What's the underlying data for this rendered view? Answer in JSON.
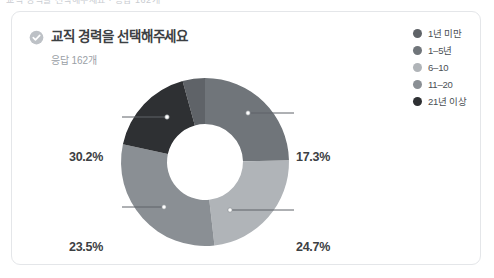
{
  "top_strip_text": "교직 경력을 선택해주세요 · 응답 162개",
  "card": {
    "header": {
      "verified_icon": "verified-check-icon",
      "title": "교직 경력을 선택해주세요",
      "subtitle": "응답 162개"
    },
    "legend": {
      "items": [
        {
          "label": "1년 미만",
          "color": "#5f6368"
        },
        {
          "label": "1–5년",
          "color": "#70757a"
        },
        {
          "label": "6–10",
          "color": "#b0b4b8"
        },
        {
          "label": "11–20",
          "color": "#8a8f94"
        },
        {
          "label": "21년 이상",
          "color": "#2e3033"
        }
      ]
    }
  },
  "chart_data": {
    "type": "pie",
    "title": "교직 경력을 선택해주세요",
    "subtitle": "응답 162개",
    "donut": true,
    "total_responses": 162,
    "units": "%",
    "legend_position": "top-right",
    "grid": false,
    "categories": [
      "1년 미만",
      "1–5년",
      "6–10",
      "11–20",
      "21년 이상"
    ],
    "values": [
      4.3,
      24.7,
      23.5,
      30.2,
      17.3
    ],
    "colors": [
      "#5f6368",
      "#70757a",
      "#b0b4b8",
      "#8a8f94",
      "#2e3033"
    ],
    "labels_shown": [
      "17.3%",
      "24.7%",
      "23.5%",
      "30.2%"
    ],
    "slices": [
      {
        "name": "1년 미만",
        "value": 4.3,
        "label": "",
        "color": "#5f6368"
      },
      {
        "name": "1–5년",
        "value": 24.7,
        "label": "24.7%",
        "color": "#70757a"
      },
      {
        "name": "6–10",
        "value": 23.5,
        "label": "23.5%",
        "color": "#b0b4b8"
      },
      {
        "name": "11–20",
        "value": 30.2,
        "label": "30.2%",
        "color": "#8a8f94"
      },
      {
        "name": "21년 이상",
        "value": 17.3,
        "label": "17.3%",
        "color": "#2e3033"
      }
    ],
    "callouts": {
      "top_left": "30.2%",
      "bottom_left": "23.5%",
      "top_right": "17.3%",
      "bottom_right": "24.7%"
    }
  }
}
